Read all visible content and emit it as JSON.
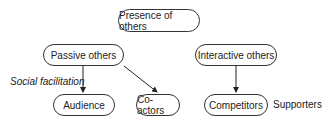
{
  "diagram": {
    "nodes": {
      "root": "Presence of others",
      "passive": "Passive others",
      "interactive": "Interactive others",
      "audience": "Audience",
      "coactors": "Co-actors",
      "competitors": "Competitors"
    },
    "labels": {
      "social_facilitation": "Social facilitation",
      "supporters": "Supporters"
    },
    "edges": [
      {
        "from": "passive",
        "to": "audience"
      },
      {
        "from": "passive",
        "to": "coactors"
      },
      {
        "from": "interactive",
        "to": "competitors"
      }
    ]
  }
}
